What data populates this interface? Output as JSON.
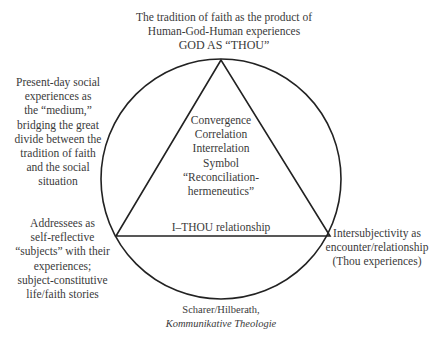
{
  "diagram": {
    "type": "circle-with-inscribed-triangle",
    "colors": {
      "stroke": "#222222",
      "text": "#3a3a3a",
      "background": "#ffffff"
    },
    "top": {
      "lines": [
        "The tradition of faith as the product of",
        "Human-God-Human experiences",
        "GOD AS “THOU”"
      ]
    },
    "left_upper": {
      "lines": [
        "Present-day social",
        "experiences as",
        "the “medium,”",
        "bridging the great",
        "divide between the",
        "tradition of faith",
        "and the social",
        "situation"
      ]
    },
    "center": {
      "lines": [
        "Convergence",
        "Correlation",
        "Interrelation",
        "Symbol",
        "“Reconciliation-",
        "hermeneutics”"
      ]
    },
    "base_label": "I–THOU relationship",
    "left_lower": {
      "lines": [
        "Addressees as",
        "self-reflective",
        "“subjects” with their",
        "experiences;",
        "subject-constitutive",
        "life/faith stories"
      ]
    },
    "right_lower": {
      "lines": [
        "Intersubjectivity as",
        "encounter/relationship",
        "(Thou experiences)"
      ]
    },
    "caption": {
      "author": "Scharer/Hilberath,",
      "title": "Kommunikative Theologie"
    }
  }
}
